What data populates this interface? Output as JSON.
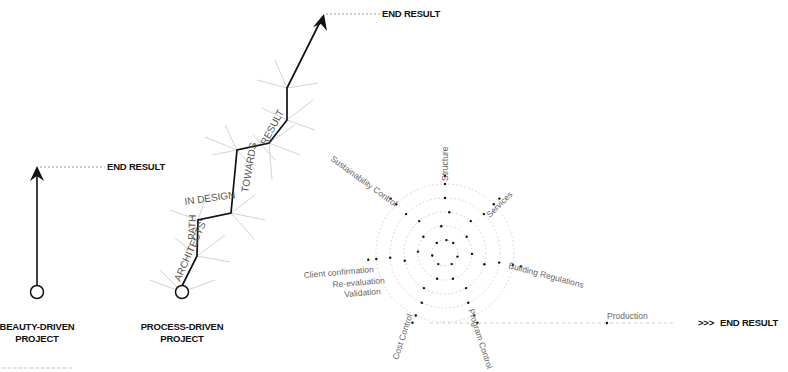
{
  "beauty_driven": {
    "end_label": "END RESULT",
    "label_line1": "BEAUTY-DRIVEN",
    "label_line2": "PROJECT"
  },
  "process_driven": {
    "end_label": "END RESULT",
    "label_line1": "PROCESS-DRIVEN",
    "label_line2": "PROJECT",
    "path_words": [
      "ARCHITECTS'",
      "PATH",
      "IN DESIGN",
      "TOWARDS",
      "RESULT"
    ]
  },
  "radial": {
    "axes": [
      {
        "label": "Structure"
      },
      {
        "label": "Services"
      },
      {
        "label": "Building Regulations"
      },
      {
        "label": "Program Control"
      },
      {
        "label": "Cost Control"
      },
      {
        "label": "Validation"
      },
      {
        "label": "Re-evaluation"
      },
      {
        "label": "Client confirmation"
      },
      {
        "label": "Sustainability Control"
      }
    ],
    "ring_count": 5,
    "production_label": "Production",
    "end_label": "END RESULT",
    "end_prefix": ">>>"
  },
  "colors": {
    "ink": "#111111",
    "branch": "#c8c8c8",
    "ring": "#cfcfcf",
    "label": "#666666"
  }
}
